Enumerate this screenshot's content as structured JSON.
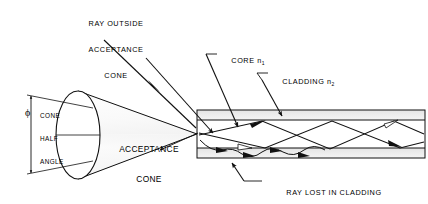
{
  "figure": {
    "type": "technical-line-diagram",
    "background": "#ffffff",
    "ink_color": "#000000"
  },
  "labels": {
    "ray_outside": {
      "line1": "RAY OUTSIDE",
      "line2": "ACCEPTANCE",
      "line3": "CONE"
    },
    "core": {
      "text": "CORE n",
      "subscript": "1"
    },
    "cladding": {
      "text": "CLADDING n",
      "subscript": "2"
    },
    "cone_half_angle": {
      "line1": "CONE",
      "line2": "HALF",
      "line3": "ANGLE",
      "symbol": "ϕ"
    },
    "acceptance_cone": {
      "line1": "ACCEPTANCE",
      "line2": "CONE"
    },
    "ray_lost": {
      "line1": "RAY LOST IN CLADDING",
      "line2": "BY ABSORPTION"
    }
  },
  "geometry": {
    "fiber": {
      "x": 197,
      "y": 110,
      "width": 228,
      "height": 48,
      "cladding_top_band": [
        110,
        120
      ],
      "core_band": [
        120,
        148
      ],
      "cladding_bottom_band": [
        148,
        158
      ]
    },
    "cone": {
      "apex_x": 197,
      "apex_y": 134,
      "face_center_x": 78,
      "face_center_y": 135,
      "face_rx": 22,
      "face_ry": 44
    }
  },
  "colors": {
    "line": "#111111",
    "cone_fill_light": "#f2f2f2",
    "cone_fill_mid": "#b8b8b8",
    "cone_fill_dark": "#6e6e6e",
    "cladding_fill": "#e8e8e8",
    "core_fill": "#ffffff"
  }
}
